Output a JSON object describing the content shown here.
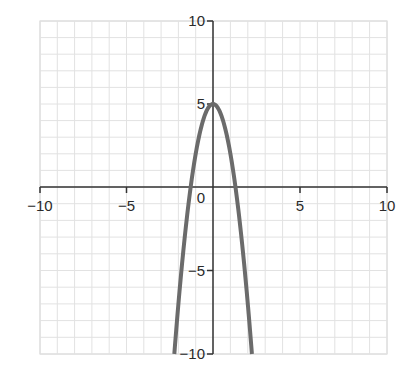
{
  "chart_data": {
    "type": "line",
    "title": "",
    "function": "y = -3x^2 + 5",
    "xlabel": "",
    "ylabel": "",
    "xlim": [
      -10,
      10
    ],
    "ylim": [
      -10,
      10
    ],
    "grid": true,
    "grid_step": 1,
    "x_ticks": [
      -10,
      -5,
      5,
      10
    ],
    "y_ticks": [
      10,
      5,
      -5,
      -10
    ],
    "x_tick_labels": [
      "−10",
      "−5",
      "5",
      "10"
    ],
    "y_tick_labels": [
      "10",
      "5",
      "−5",
      "−10"
    ],
    "origin_label": "0",
    "series": [
      {
        "name": "parabola",
        "color": "#6b6b6b",
        "x": [
          -2.236,
          -2,
          -1.5,
          -1.291,
          -1,
          -0.5,
          0,
          0.5,
          1,
          1.291,
          1.5,
          2,
          2.236
        ],
        "y": [
          -10,
          -7,
          -1.75,
          0,
          2,
          4.25,
          5,
          4.25,
          2,
          0,
          -1.75,
          -7,
          -10
        ]
      }
    ],
    "key_points": {
      "vertex": [
        0,
        5
      ],
      "x_intercepts": [
        -1.291,
        1.291
      ]
    },
    "colors": {
      "grid": "#e2e2e2",
      "axis": "#333333",
      "curve": "#6b6b6b"
    }
  }
}
